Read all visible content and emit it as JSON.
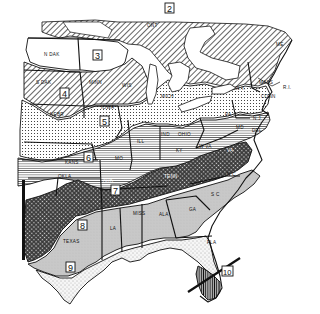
{
  "map": {
    "title": "",
    "background": "#ffffff",
    "ink": "#111111",
    "zones": [
      {
        "id": "2",
        "label": "2",
        "pattern": "diagonal-hatch",
        "region": "Ontario / northern Great Lakes / northern New England"
      },
      {
        "id": "3",
        "label": "3",
        "pattern": "blank",
        "region": "North Dakota / northern Minnesota"
      },
      {
        "id": "4",
        "label": "4",
        "pattern": "diagonal-hatch",
        "region": "South Dakota / southern Minnesota / Wisconsin"
      },
      {
        "id": "5",
        "label": "5",
        "pattern": "dotted",
        "region": "Nebraska / Iowa / Michigan / New York"
      },
      {
        "id": "6",
        "label": "6",
        "pattern": "horizontal-lines",
        "region": "Kansas / Missouri / Illinois / Indiana / Ohio / Pennsylvania"
      },
      {
        "id": "7",
        "label": "7",
        "pattern": "crosshatch-dark",
        "region": "Oklahoma / Arkansas / Tennessee / Virginia"
      },
      {
        "id": "8",
        "label": "8",
        "pattern": "light-gray",
        "region": "Texas / Louisiana / Mississippi / Alabama / Georgia / Carolinas"
      },
      {
        "id": "9",
        "label": "9",
        "pattern": "sparse-dots",
        "region": "South Texas / Gulf Coast / north Florida"
      },
      {
        "id": "10",
        "label": "10",
        "pattern": "dark-vertical",
        "region": "South Florida"
      }
    ],
    "state_labels": {
      "ont": "ONT",
      "n_dak": "N DAK",
      "s_dak": "S DAK",
      "minn": "MINN",
      "wis": "WIS",
      "nebr": "NEBR",
      "iowa": "IOWA",
      "mich": "MICH",
      "ill": "ILL",
      "ind": "IND",
      "ohio": "OHIO",
      "pa": "PA",
      "ny": "N.Y.",
      "me": "ME",
      "mass": "MASS",
      "conn": "CONN",
      "ri": "R.I.",
      "nj": "N.J.",
      "del": "DEL",
      "md": "MD",
      "kans": "KANS",
      "mo": "MO",
      "ky": "KY",
      "w_va": "W VA",
      "va": "VA",
      "okla": "OKLA",
      "ark": "ARK",
      "tenn": "TENN",
      "n_c": "N C",
      "s_c": "S C",
      "texas": "TEXAS",
      "la": "LA",
      "miss": "MISS",
      "ala": "ALA",
      "ga": "GA",
      "fla": "FLA"
    }
  }
}
